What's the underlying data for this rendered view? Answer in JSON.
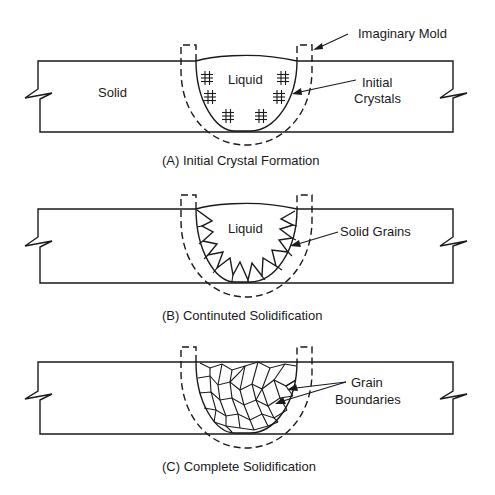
{
  "panels": [
    {
      "id": "A",
      "caption": "(A) Initial Crystal Formation",
      "labels": {
        "solid": "Solid",
        "liquid": "Liquid",
        "mold": "Imaginary Mold",
        "crystals_line1": "Initial",
        "crystals_line2": "Crystals"
      }
    },
    {
      "id": "B",
      "caption": "(B) Continuted Solidification",
      "labels": {
        "liquid": "Liquid",
        "grains": "Solid Grains"
      }
    },
    {
      "id": "C",
      "caption": "(C) Complete Solidification",
      "labels": {
        "boundaries_line1": "Grain",
        "boundaries_line2": "Boundaries"
      }
    }
  ],
  "colors": {
    "line": "#1a1a1a",
    "background": "#ffffff"
  }
}
